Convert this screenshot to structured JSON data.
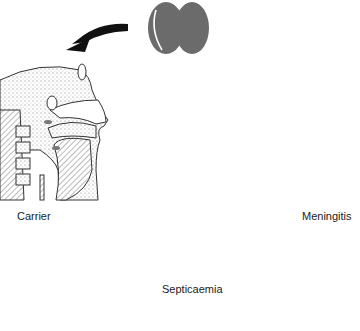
{
  "diagram": {
    "title": "",
    "nodes": [
      {
        "id": "diplococcus",
        "label": "",
        "icon": "diplococcus-bacteria-icon",
        "color": "#6b6b6b"
      },
      {
        "id": "carrier",
        "label": "Carrier",
        "icon": "nasopharynx-cross-section"
      },
      {
        "id": "septicaemia",
        "label": "Septicaemia",
        "icon": "circulatory-system-body"
      },
      {
        "id": "meningitis",
        "label": "Meningitis",
        "icon": "brain-sagittal-section"
      }
    ],
    "edges": [
      {
        "from": "diplococcus",
        "to": "carrier"
      },
      {
        "from": "carrier",
        "to": "septicaemia"
      },
      {
        "from": "septicaemia",
        "to": "meningitis"
      },
      {
        "from": "meningitis",
        "to": "septicaemia"
      }
    ],
    "colors": {
      "arrow": "#111111",
      "vessel": "#7a7a7a",
      "outline": "#444444",
      "bacteria": "#6b6b6b"
    }
  }
}
